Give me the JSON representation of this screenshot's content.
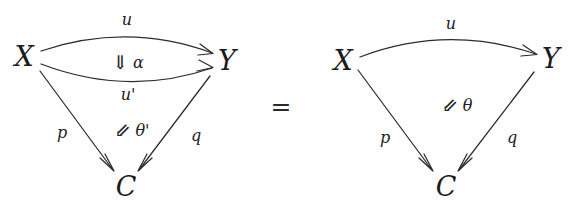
{
  "figure": {
    "kind": "commutative-2-cell-pasting-diagram",
    "relation": "=",
    "background_color": "#ffffff",
    "ink_color": "#2b2b2b"
  },
  "left_diagram": {
    "objects": {
      "source": "X",
      "target": "Y",
      "apex": "C"
    },
    "arrows": {
      "top": "u",
      "bottom": "u'",
      "left": "p",
      "right": "q"
    },
    "two_cells": [
      {
        "arrow_glyph": "⇓",
        "arrow_name": "double-down-arrow",
        "label": "α"
      },
      {
        "arrow_glyph": "⇙",
        "arrow_name": "double-down-left-arrow",
        "label": "θ'"
      }
    ]
  },
  "right_diagram": {
    "objects": {
      "source": "X",
      "target": "Y",
      "apex": "C"
    },
    "arrows": {
      "top": "u",
      "left": "p",
      "right": "q"
    },
    "two_cells": [
      {
        "arrow_glyph": "⇙",
        "arrow_name": "double-down-left-arrow",
        "label": "θ"
      }
    ]
  }
}
